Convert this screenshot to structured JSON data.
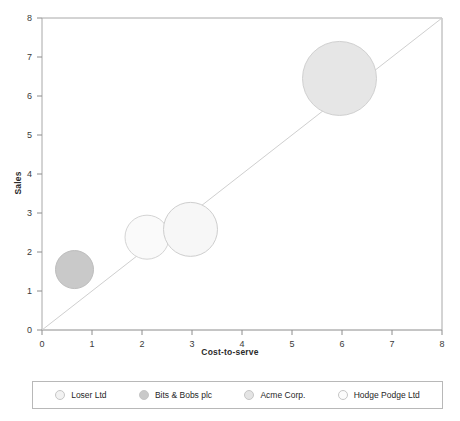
{
  "chart_data": {
    "type": "scatter",
    "title": "",
    "xlabel": "Cost-to-serve",
    "ylabel": "Sales",
    "xlim": [
      0,
      8
    ],
    "ylim": [
      0,
      8
    ],
    "xticks": [
      "0",
      "1",
      "2",
      "3",
      "4",
      "5",
      "6",
      "7",
      "8"
    ],
    "yticks": [
      "0",
      "1",
      "2",
      "3",
      "4",
      "5",
      "6",
      "7",
      "8"
    ],
    "grid": false,
    "legend_position": "bottom",
    "reference_line": {
      "name": "diagonal-parity-line",
      "from": [
        0,
        0
      ],
      "to": [
        8,
        8
      ],
      "color": "#cfcfcf"
    },
    "series": [
      {
        "name": "Loser Ltd",
        "x": 0.65,
        "y": 1.55,
        "radius_px": 19,
        "fill": "#c9c9c9",
        "stroke": "#bdbdbd"
      },
      {
        "name": "Bits & Bobs plc",
        "x": 2.1,
        "y": 2.38,
        "radius_px": 22,
        "fill": "#fafafa",
        "stroke": "#d4d4d4"
      },
      {
        "name": "Acme Corp.",
        "x": 2.97,
        "y": 2.58,
        "radius_px": 27,
        "fill": "#f7f7f7",
        "stroke": "#cecece"
      },
      {
        "name": "Hodge Podge Ltd",
        "x": 5.95,
        "y": 6.45,
        "radius_px": 37,
        "fill": "#e6e6e6",
        "stroke": "#d0d0d0"
      }
    ]
  },
  "legend": {
    "items": [
      {
        "label": "Loser Ltd",
        "color": "#f2f2f2"
      },
      {
        "label": "Bits & Bobs plc",
        "color": "#c9c9c9"
      },
      {
        "label": "Acme Corp.",
        "color": "#e4e4e4"
      },
      {
        "label": "Hodge Podge Ltd",
        "color": "#fcfcfc"
      }
    ]
  }
}
